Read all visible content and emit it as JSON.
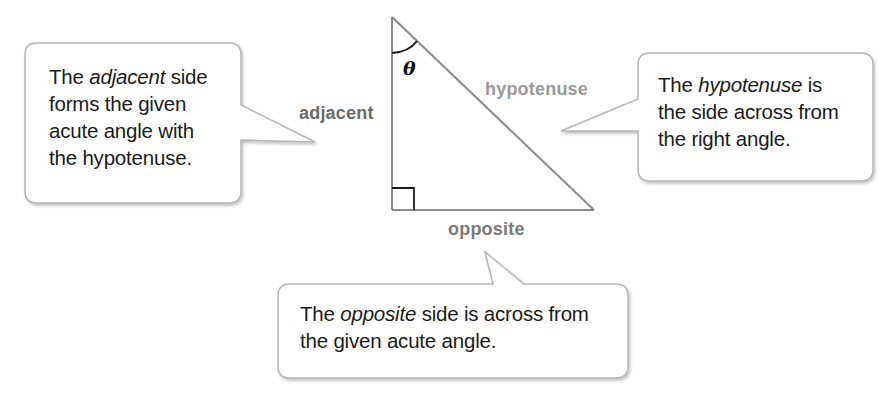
{
  "diagram": {
    "angle_symbol": "θ",
    "labels": {
      "adjacent": "adjacent",
      "hypotenuse": "hypotenuse",
      "opposite": "opposite"
    },
    "label_colors": {
      "adjacent": "#6a6a6a",
      "hypotenuse": "#9a9a9a",
      "opposite": "#7a7a7a"
    },
    "callouts": {
      "adjacent": {
        "pre": "The ",
        "term": "adjacent",
        "post_line1": " side",
        "line2": "forms the given",
        "line3": "acute angle with",
        "line4": "the hypotenuse."
      },
      "hypotenuse": {
        "pre": "The ",
        "term": "hypotenuse",
        "post_line1": " is",
        "line2": "the side across from",
        "line3": "the right angle."
      },
      "opposite": {
        "pre": "The ",
        "term": "opposite",
        "post_line1": " side is across from",
        "line2": "the given acute angle."
      }
    }
  }
}
